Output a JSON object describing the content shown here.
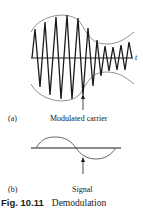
{
  "figure": {
    "panel_a": {
      "tag": "(a)",
      "label": "Modulated carrier",
      "axis_label": "t"
    },
    "panel_b": {
      "tag": "(b)",
      "label": "Signal"
    },
    "caption": {
      "number": "Fig. 10.11",
      "text": "Demodulation"
    }
  }
}
